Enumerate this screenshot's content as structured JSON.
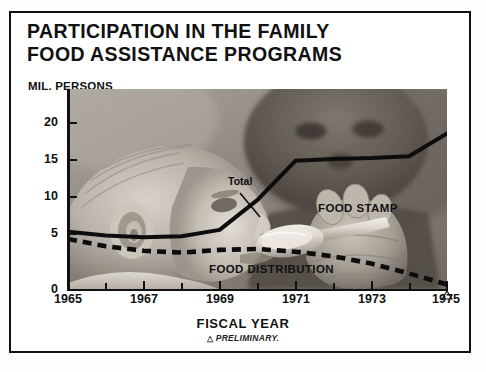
{
  "title": {
    "line1": "PARTICIPATION IN THE FAMILY",
    "line2": "FOOD ASSISTANCE PROGRAMS"
  },
  "axis_unit_label": "MIL. PERSONS",
  "x_axis_caption": "FISCAL YEAR",
  "footnote": {
    "marker": "△",
    "text": "PRELIMINARY."
  },
  "labels": {
    "total": "Total",
    "food_stamp": "FOOD STAMP",
    "food_distribution": "FOOD DISTRIBUTION"
  },
  "photo": {
    "description": "baby-being-spoon-fed-photograph"
  },
  "colors": {
    "line": "#111111",
    "frame": "#111111",
    "background": "#ffffff"
  },
  "chart_data": {
    "type": "line",
    "title": "PARTICIPATION IN THE FAMILY FOOD ASSISTANCE PROGRAMS",
    "subtitle": "",
    "xlabel": "FISCAL YEAR",
    "ylabel": "MIL. PERSONS",
    "xlim": [
      1965,
      1975
    ],
    "ylim": [
      0,
      22
    ],
    "yticks": [
      0,
      5,
      10,
      15,
      20
    ],
    "ytick_labels": [
      "0",
      "5",
      "10",
      "15",
      "20"
    ],
    "xticks": [
      1965,
      1966,
      1967,
      1968,
      1969,
      1970,
      1971,
      1972,
      1973,
      1974,
      1975
    ],
    "xtick_labels": [
      "1965",
      "",
      "1967",
      "",
      "1969",
      "",
      "1971",
      "",
      "1973",
      "",
      "1975"
    ],
    "grid": false,
    "legend": "inline-annotations",
    "x": [
      1965,
      1966,
      1967,
      1968,
      1969,
      1970,
      1971,
      1972,
      1973,
      1974,
      1975
    ],
    "series": [
      {
        "name": "Total",
        "style": "solid",
        "values": [
          6.3,
          5.9,
          5.7,
          5.8,
          6.5,
          9.8,
          14.1,
          14.3,
          14.4,
          14.6,
          17.1
        ]
      },
      {
        "name": "FOOD DISTRIBUTION",
        "style": "dashed",
        "values": [
          5.5,
          4.7,
          4.2,
          4.0,
          4.3,
          4.4,
          4.1,
          3.6,
          2.8,
          1.7,
          0.5
        ]
      }
    ],
    "annotations": [
      {
        "text": "Total",
        "x": 1969.2,
        "y": 9.5
      },
      {
        "text": "FOOD STAMP",
        "x": 1971.5,
        "y": 7.0
      },
      {
        "text": "FOOD DISTRIBUTION",
        "x": 1968.9,
        "y": 3.2
      },
      {
        "text": "△ PRELIMINARY.",
        "x": 1975,
        "y": 0
      }
    ]
  }
}
